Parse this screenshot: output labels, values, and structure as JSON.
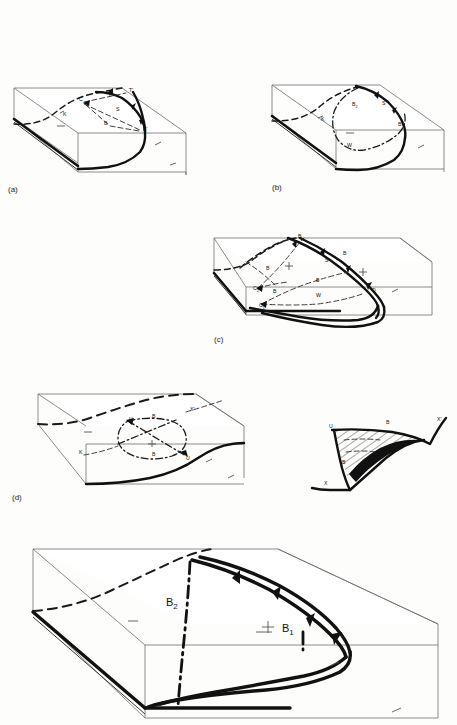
{
  "figure": {
    "type": "structural-geology-block-diagrams",
    "background_color": "#fdfdfc",
    "ink_color": "#111111",
    "panels": [
      {
        "id": "a",
        "label": "(a)",
        "labels": [
          {
            "text": "C",
            "x": 79,
            "y": 101
          },
          {
            "text": "T",
            "x": 108,
            "y": 97
          },
          {
            "text": "T'",
            "x": 129,
            "y": 92
          },
          {
            "text": "S",
            "x": 116,
            "y": 111
          },
          {
            "text": "B",
            "x": 104,
            "y": 125
          },
          {
            "text": "B'",
            "x": 143,
            "y": 131
          },
          {
            "text": "K",
            "x": 63,
            "y": 116
          }
        ]
      },
      {
        "id": "b",
        "label": "(b)",
        "labels": [
          {
            "text": "B2",
            "base": "B",
            "subscript": "2",
            "x": 352,
            "y": 106
          },
          {
            "text": "S",
            "x": 382,
            "y": 105
          },
          {
            "text": "B1",
            "base": "B",
            "subscript": "1",
            "x": 398,
            "y": 126
          },
          {
            "text": "K",
            "x": 321,
            "y": 121
          },
          {
            "text": "W",
            "x": 347,
            "y": 147
          }
        ]
      },
      {
        "id": "c",
        "label": "(c)",
        "labels": [
          {
            "text": "B",
            "x": 298,
            "y": 238
          },
          {
            "text": "B",
            "x": 343,
            "y": 255
          },
          {
            "text": "S",
            "x": 325,
            "y": 262
          },
          {
            "text": "B",
            "x": 266,
            "y": 270
          },
          {
            "text": "B",
            "x": 316,
            "y": 282
          },
          {
            "text": "C2",
            "base": "C",
            "subscript": "2",
            "x": 253,
            "y": 290
          },
          {
            "text": "B",
            "x": 273,
            "y": 293
          },
          {
            "text": "C1",
            "base": "C",
            "subscript": "1",
            "x": 259,
            "y": 307
          },
          {
            "text": "W",
            "x": 316,
            "y": 297
          },
          {
            "text": "D",
            "x": 372,
            "y": 292
          }
        ]
      },
      {
        "id": "d",
        "label": "(d)",
        "labels": [
          {
            "text": "U",
            "x": 129,
            "y": 421
          },
          {
            "text": "B",
            "x": 152,
            "y": 418
          },
          {
            "text": "X'",
            "x": 190,
            "y": 411
          },
          {
            "text": "K",
            "x": 79,
            "y": 454
          },
          {
            "text": "B",
            "x": 152,
            "y": 456
          },
          {
            "text": "U",
            "x": 186,
            "y": 460
          }
        ],
        "inset": {
          "id": "d-inset",
          "labels": [
            {
              "text": "U",
              "x": 329,
              "y": 428
            },
            {
              "text": "B",
              "x": 386,
              "y": 424
            },
            {
              "text": "X'",
              "x": 437,
              "y": 421
            },
            {
              "text": "B",
              "x": 342,
              "y": 464
            },
            {
              "text": "X",
              "x": 324,
              "y": 485
            }
          ]
        }
      },
      {
        "id": "e",
        "label": "",
        "labels": [
          {
            "text": "B2",
            "base": "B",
            "subscript": "2",
            "x": 172,
            "y": 604
          },
          {
            "text": "B1",
            "base": "B",
            "subscript": "1",
            "x": 288,
            "y": 630
          }
        ]
      }
    ],
    "legend_symbols": [
      {
        "name": "thrust-teeth",
        "meaning": "thrust fault with teeth on hanging wall"
      },
      {
        "name": "dash-dot-axis",
        "meaning": "fold axis trace"
      },
      {
        "name": "dashed-trace",
        "meaning": "concealed / projected trace"
      },
      {
        "name": "strike-dip-tick",
        "meaning": "strike and dip symbol"
      }
    ]
  }
}
